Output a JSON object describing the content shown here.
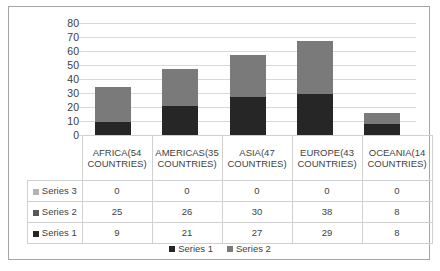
{
  "chart_data": {
    "type": "bar",
    "subtype": "stacked-column",
    "title": "",
    "xlabel": "",
    "ylabel": "",
    "ylim": [
      0,
      80
    ],
    "ytick_step": 10,
    "yticks": [
      80,
      70,
      60,
      50,
      40,
      30,
      20,
      10,
      0
    ],
    "grid": true,
    "legend_position": "bottom",
    "categories": [
      "AFRICA(54 COUNTRIES)",
      "AMERICAS(35 COUNTRIES)",
      "ASIA(47 COUNTRIES)",
      "EUROPE(43 COUNTRIES)",
      "OCEANIA(14 COUNTRIES)"
    ],
    "series": [
      {
        "name": "Series 1",
        "color": "#262626",
        "values": [
          9,
          21,
          27,
          29,
          8
        ]
      },
      {
        "name": "Series 2",
        "color": "#7a7a7a",
        "values": [
          25,
          26,
          30,
          38,
          8
        ]
      },
      {
        "name": "Series 3",
        "color": "#c8c8c8",
        "values": [
          0,
          0,
          0,
          0,
          0
        ]
      }
    ],
    "totals": [
      34,
      47,
      57,
      67,
      16
    ]
  },
  "table": {
    "row_order": [
      "Series 3",
      "Series 2",
      "Series 1"
    ],
    "header": {
      "corner": "",
      "columns": [
        "AFRICA(54 COUNTRIES)",
        "AMERICAS(35 COUNTRIES)",
        "ASIA(47 COUNTRIES)",
        "EUROPE(43 COUNTRIES)",
        "OCEANIA(14 COUNTRIES)"
      ]
    },
    "rows": [
      {
        "key": "Series 3",
        "swatch": "#b3b3b3",
        "values": [
          "0",
          "0",
          "0",
          "0",
          "0"
        ]
      },
      {
        "key": "Series 2",
        "swatch": "#595959",
        "values": [
          "25",
          "26",
          "30",
          "38",
          "8"
        ]
      },
      {
        "key": "Series 1",
        "swatch": "#262626",
        "values": [
          "9",
          "21",
          "27",
          "29",
          "8"
        ]
      }
    ]
  },
  "legend": {
    "entries": [
      {
        "label": "Series 1",
        "color": "#262626"
      },
      {
        "label": "Series 2",
        "color": "#7a7a7a"
      }
    ]
  }
}
